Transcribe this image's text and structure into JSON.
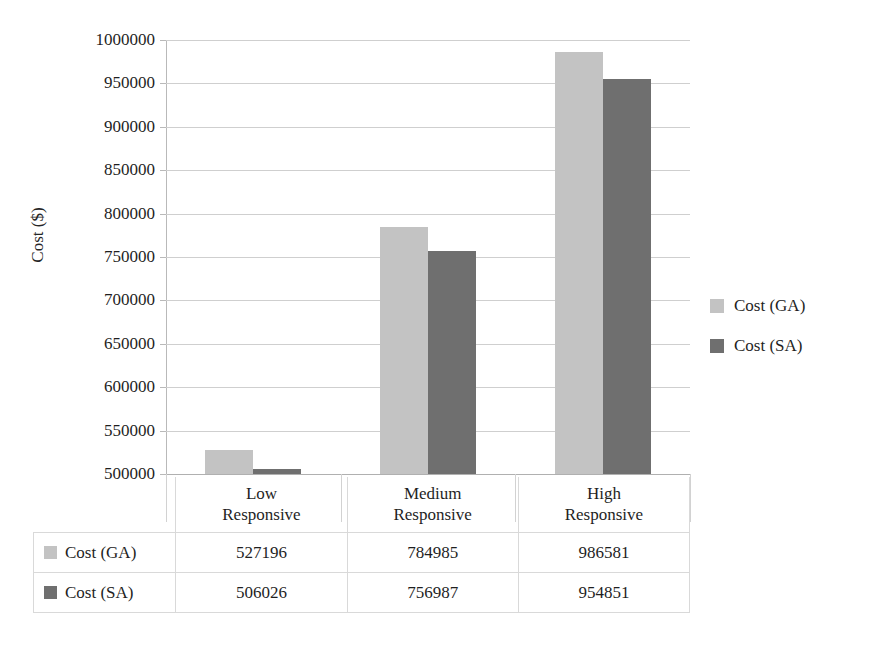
{
  "chart_data": {
    "type": "bar",
    "title": "",
    "xlabel": "",
    "ylabel": "Cost ($)",
    "categories": [
      "Low Responsive",
      "Medium Responsive",
      "High Responsive"
    ],
    "category_lines": [
      [
        "Low",
        "Responsive"
      ],
      [
        "Medium",
        "Responsive"
      ],
      [
        "High",
        "Responsive"
      ]
    ],
    "series": [
      {
        "name": "Cost (GA)",
        "color": "#c3c3c3",
        "values": [
          527196,
          784985,
          986581
        ]
      },
      {
        "name": "Cost (SA)",
        "color": "#6f6f6f",
        "values": [
          506026,
          756987,
          954851
        ]
      }
    ],
    "ylim": [
      500000,
      1000000
    ],
    "ytick_step": 50000,
    "yticks": [
      1000000,
      950000,
      900000,
      850000,
      800000,
      750000,
      700000,
      650000,
      600000,
      550000,
      500000
    ],
    "ytick_labels": [
      "1000000",
      "950000",
      "900000",
      "850000",
      "800000",
      "750000",
      "700000",
      "650000",
      "600000",
      "550000",
      "500000"
    ],
    "grid": true,
    "legend_position": "right"
  },
  "legend": {
    "items": [
      {
        "label": "Cost (GA)",
        "swatch": "ga"
      },
      {
        "label": "Cost (SA)",
        "swatch": "sa"
      }
    ]
  },
  "data_table": {
    "corner_label": "",
    "column_headers": [
      {
        "line1": "Low",
        "line2": "Responsive"
      },
      {
        "line1": "Medium",
        "line2": "Responsive"
      },
      {
        "line1": "High",
        "line2": "Responsive"
      }
    ],
    "rows": [
      {
        "series": "Cost (GA)",
        "swatch": "ga",
        "values": [
          "527196",
          "784985",
          "986581"
        ]
      },
      {
        "series": "Cost (SA)",
        "swatch": "sa",
        "values": [
          "506026",
          "756987",
          "954851"
        ]
      }
    ]
  }
}
